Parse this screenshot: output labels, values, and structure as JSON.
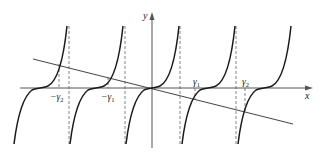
{
  "figure": {
    "axes": {
      "x_label": "x",
      "y_label": "y"
    },
    "tick_labels": [
      {
        "id": "neg-gamma2",
        "text": "−γ2",
        "base": "−γ",
        "sub": "2",
        "x": 59
      },
      {
        "id": "neg-gamma1",
        "text": "−γ1",
        "base": "−γ",
        "sub": "1",
        "x": 108
      },
      {
        "id": "gamma1",
        "text": "γ1",
        "base": "γ",
        "sub": "1",
        "x": 195
      },
      {
        "id": "gamma2",
        "text": "γ2",
        "base": "γ",
        "sub": "2",
        "x": 245
      }
    ],
    "colors": {
      "curve": "#1a1a1a",
      "line": "#444444",
      "axis": "#555555",
      "dashed": "#777777"
    }
  },
  "labels": {
    "x_axis": "x",
    "y_axis": "y",
    "neg_gamma2_base": "−γ",
    "neg_gamma2_sub": "2",
    "neg_gamma1_base": "−γ",
    "neg_gamma1_sub": "1",
    "gamma1_base": "γ",
    "gamma1_sub": "1",
    "gamma2_base": "γ",
    "gamma2_sub": "2"
  }
}
